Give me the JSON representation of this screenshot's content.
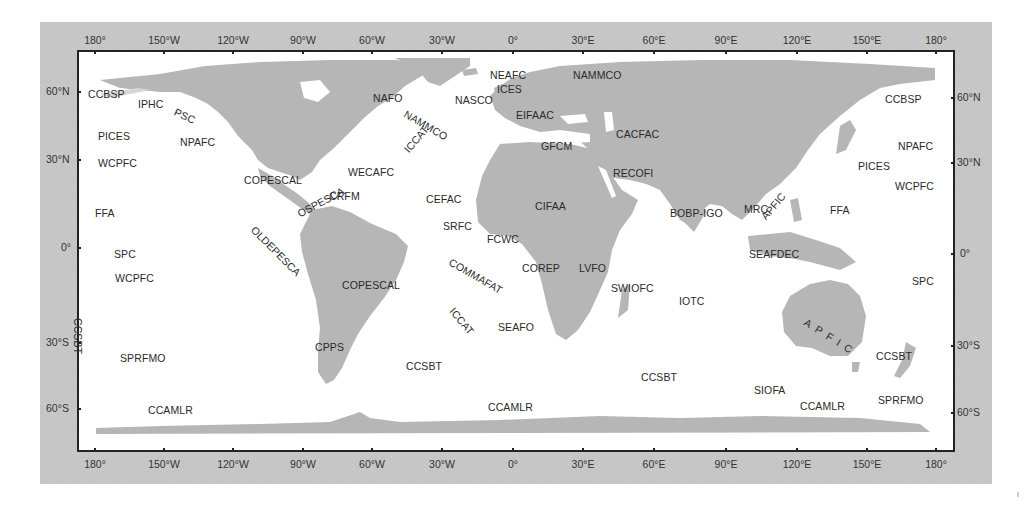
{
  "map": {
    "title": "World map of regional fisheries bodies",
    "colors": {
      "frame": "#c4c4c4",
      "ocean": "#ffffff",
      "land": "#b4b4b4",
      "border": "#222222",
      "text": "#2a2a2a"
    },
    "longitude_ticks_top": [
      "180°",
      "150°W",
      "120°W",
      "90°W",
      "60°W",
      "30°W",
      "0°",
      "30°E",
      "60°E",
      "90°E",
      "120°E",
      "150°E",
      "180°"
    ],
    "longitude_ticks_bottom": [
      "180°",
      "150°W",
      "120°W",
      "90°W",
      "60°W",
      "30°W",
      "0°",
      "30°E",
      "60°E",
      "90°E",
      "120°E",
      "150°E",
      "180°"
    ],
    "latitude_ticks_left": [
      "60°N",
      "30°N",
      "0°",
      "30°S",
      "60°S"
    ],
    "latitude_ticks_right": [
      "60°N",
      "30°N",
      "0°",
      "30°S",
      "60°S"
    ],
    "labels": [
      {
        "text": "CCBSP",
        "x": 88,
        "y": 88,
        "rot": 0
      },
      {
        "text": "IPHC",
        "x": 138,
        "y": 98,
        "rot": 0
      },
      {
        "text": "PSC",
        "x": 175,
        "y": 105,
        "rot": 25
      },
      {
        "text": "PICES",
        "x": 98,
        "y": 130,
        "rot": 0
      },
      {
        "text": "NPAFC",
        "x": 180,
        "y": 136,
        "rot": 0
      },
      {
        "text": "WCPFC",
        "x": 98,
        "y": 157,
        "rot": 0
      },
      {
        "text": "FFA",
        "x": 95,
        "y": 207,
        "rot": 0
      },
      {
        "text": "SPC",
        "x": 114,
        "y": 248,
        "rot": 0
      },
      {
        "text": "WCPFC",
        "x": 115,
        "y": 272,
        "rot": 0
      },
      {
        "text": "CCSBT",
        "x": 78,
        "y": 312,
        "rot": 90
      },
      {
        "text": "SPRFMO",
        "x": 120,
        "y": 352,
        "rot": 0
      },
      {
        "text": "CCAMLR",
        "x": 148,
        "y": 404,
        "rot": 0
      },
      {
        "text": "COPESCAL",
        "x": 244,
        "y": 174,
        "rot": 0
      },
      {
        "text": "OLDEPESCA",
        "x": 253,
        "y": 222,
        "rot": 45
      },
      {
        "text": "OSPESCA",
        "x": 298,
        "y": 208,
        "rot": -28
      },
      {
        "text": "CRFM",
        "x": 329,
        "y": 190,
        "rot": 0
      },
      {
        "text": "WECAFC",
        "x": 348,
        "y": 166,
        "rot": 0
      },
      {
        "text": "COPESCAL",
        "x": 342,
        "y": 279,
        "rot": 0
      },
      {
        "text": "CPPS",
        "x": 315,
        "y": 341,
        "rot": 0
      },
      {
        "text": "CCSBT",
        "x": 406,
        "y": 360,
        "rot": 0
      },
      {
        "text": "NAFO",
        "x": 373,
        "y": 92,
        "rot": 0
      },
      {
        "text": "NAMMCO",
        "x": 405,
        "y": 107,
        "rot": 30
      },
      {
        "text": "ICCAT",
        "x": 406,
        "y": 145,
        "rot": -50
      },
      {
        "text": "NASCO",
        "x": 455,
        "y": 94,
        "rot": 0
      },
      {
        "text": "NEAFC",
        "x": 490,
        "y": 69,
        "rot": 0
      },
      {
        "text": "ICES",
        "x": 497,
        "y": 83,
        "rot": 0
      },
      {
        "text": "NAMMCO",
        "x": 573,
        "y": 69,
        "rot": 0
      },
      {
        "text": "EIFAAC",
        "x": 516,
        "y": 109,
        "rot": 0
      },
      {
        "text": "GFCM",
        "x": 541,
        "y": 140,
        "rot": 0
      },
      {
        "text": "CACFAC",
        "x": 616,
        "y": 128,
        "rot": 0
      },
      {
        "text": "RECOFI",
        "x": 613,
        "y": 167,
        "rot": 0
      },
      {
        "text": "CEFAC",
        "x": 426,
        "y": 193,
        "rot": 0
      },
      {
        "text": "CIFAA",
        "x": 535,
        "y": 200,
        "rot": 0
      },
      {
        "text": "SRFC",
        "x": 443,
        "y": 220,
        "rot": 0
      },
      {
        "text": "FCWC",
        "x": 487,
        "y": 233,
        "rot": 0
      },
      {
        "text": "COMMAFAT",
        "x": 450,
        "y": 255,
        "rot": 30
      },
      {
        "text": "COREP",
        "x": 522,
        "y": 262,
        "rot": 0
      },
      {
        "text": "LVFO",
        "x": 579,
        "y": 262,
        "rot": 0
      },
      {
        "text": "SWIOFC",
        "x": 611,
        "y": 282,
        "rot": 0
      },
      {
        "text": "ICCAT",
        "x": 452,
        "y": 303,
        "rot": 50
      },
      {
        "text": "SEAFO",
        "x": 498,
        "y": 321,
        "rot": 0
      },
      {
        "text": "CCAMLR",
        "x": 488,
        "y": 401,
        "rot": 0
      },
      {
        "text": "IOTC",
        "x": 679,
        "y": 295,
        "rot": 0
      },
      {
        "text": "CCSBT",
        "x": 641,
        "y": 371,
        "rot": 0
      },
      {
        "text": "SIOFA",
        "x": 754,
        "y": 384,
        "rot": 0
      },
      {
        "text": "CCAMLR",
        "x": 800,
        "y": 400,
        "rot": 0
      },
      {
        "text": "BOBP-IGO",
        "x": 670,
        "y": 207,
        "rot": 0
      },
      {
        "text": "MRC",
        "x": 744,
        "y": 203,
        "rot": 0
      },
      {
        "text": "APFIC",
        "x": 763,
        "y": 212,
        "rot": -50
      },
      {
        "text": "SEAFDEC",
        "x": 749,
        "y": 248,
        "rot": 0
      },
      {
        "text": "FFA",
        "x": 830,
        "y": 204,
        "rot": 0
      },
      {
        "text": "PICES",
        "x": 858,
        "y": 160,
        "rot": 0
      },
      {
        "text": "NPAFC",
        "x": 898,
        "y": 140,
        "rot": 0
      },
      {
        "text": "WCPFC",
        "x": 895,
        "y": 180,
        "rot": 0
      },
      {
        "text": "CCBSP",
        "x": 885,
        "y": 93,
        "rot": 0
      },
      {
        "text": "SPC",
        "x": 912,
        "y": 275,
        "rot": 0
      },
      {
        "text": "APFIC",
        "x": 805,
        "y": 315,
        "rot": 32,
        "spaced": true
      },
      {
        "text": "CCSBT",
        "x": 876,
        "y": 350,
        "rot": 0
      },
      {
        "text": "SPRFMO",
        "x": 878,
        "y": 394,
        "rot": 0
      }
    ]
  }
}
